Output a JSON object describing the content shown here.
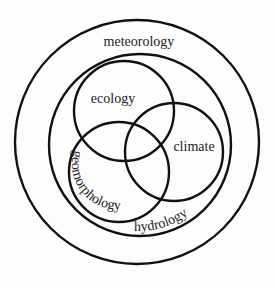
{
  "diagram": {
    "type": "nested-venn",
    "stroke_color": "#111111",
    "background": "#fdfdfd",
    "sets": [
      {
        "id": "meteorology",
        "label": "meteorology",
        "cx": 137,
        "cy": 142,
        "r": 122
      },
      {
        "id": "hydrology",
        "label": "hydrology",
        "cx": 140,
        "cy": 145,
        "r": 91
      },
      {
        "id": "ecology",
        "label": "ecology",
        "cx": 124,
        "cy": 111,
        "r": 50
      },
      {
        "id": "climate",
        "label": "climate",
        "cx": 174,
        "cy": 152,
        "r": 49
      },
      {
        "id": "geomorphology",
        "label": "geomorphology",
        "cx": 119,
        "cy": 172,
        "r": 50
      }
    ],
    "relationships": "meteorology contains hydrology; hydrology contains ecology, climate and geomorphology, which mutually overlap"
  }
}
